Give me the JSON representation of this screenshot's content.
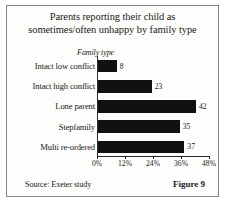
{
  "figure": {
    "title_line1": "Parents reporting their child as",
    "title_line2": "sometimes/often unhappy by family type",
    "source": "Source: Exeter study",
    "figure_number": "Figure 9",
    "border_color": "#8a867e",
    "bar_color": "#111111",
    "background": "#fdfdfb"
  },
  "chart_data": {
    "type": "bar",
    "orientation": "horizontal",
    "title": "Parents reporting their child as sometimes/often unhappy by family type",
    "categories": [
      "Intact low conflict",
      "Intact high conflict",
      "Lone parent",
      "Stepfamily",
      "Multi re-ordered"
    ],
    "values": [
      8,
      23,
      42,
      35,
      37
    ],
    "value_labels": [
      "8",
      "23",
      "42",
      "35",
      "37"
    ],
    "xlabel": "",
    "ylabel": "Family type",
    "xlim": [
      0,
      48
    ],
    "xticks": [
      0,
      12,
      24,
      36,
      48
    ],
    "xtick_labels": [
      "0%",
      "12%",
      "24%",
      "36%",
      "48%"
    ],
    "grid": false,
    "legend": false,
    "series_color": "#111111"
  }
}
